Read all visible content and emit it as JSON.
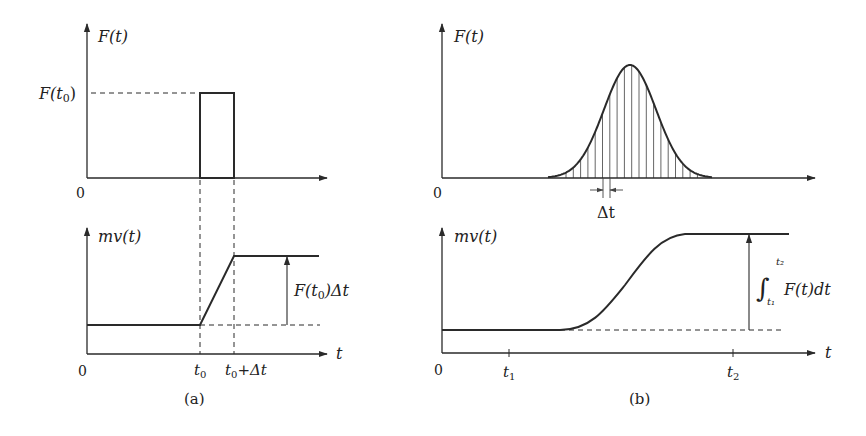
{
  "colors": {
    "stroke": "#2a2a2a",
    "hatch": "#555555",
    "background": "#ffffff"
  },
  "panel_a": {
    "caption": "(a)",
    "top": {
      "y_label": "F(t)",
      "origin_label": "0",
      "level_label_main": "F(t",
      "level_label_sub": "0",
      "level_label_close": ")"
    },
    "bottom": {
      "y_label": "mv(t)",
      "x_label": "t",
      "origin_label": "0",
      "tick_t0_main": "t",
      "tick_t0_sub": "0",
      "tick_t0dt_main": "t",
      "tick_t0dt_sub": "0",
      "tick_t0dt_rest": "+Δt",
      "impulse_label_main": "F(t",
      "impulse_label_sub": "0",
      "impulse_label_rest": ")Δt"
    }
  },
  "panel_b": {
    "caption": "(b)",
    "top": {
      "y_label": "F(t)",
      "origin_label": "0",
      "delta_label": "Δt"
    },
    "bottom": {
      "y_label": "mv(t)",
      "x_label": "t",
      "origin_label": "0",
      "tick_t1_main": "t",
      "tick_t1_sub": "1",
      "tick_t2_main": "t",
      "tick_t2_sub": "2",
      "integral_symbol": "∫",
      "integral_upper": "t₂",
      "integral_lower": "t₁",
      "integral_body": "F(t)dt"
    }
  }
}
